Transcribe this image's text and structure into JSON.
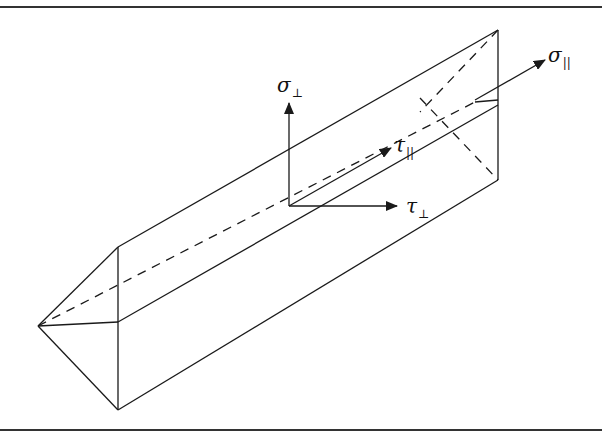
{
  "diagram": {
    "type": "prism stress components",
    "labels": {
      "sigma_perp": {
        "symbol": "σ",
        "subscript": "⊥"
      },
      "sigma_par": {
        "symbol": "σ",
        "subscript": "||"
      },
      "tau_par": {
        "symbol": "τ",
        "subscript": "||"
      },
      "tau_perp": {
        "symbol": "τ",
        "subscript": "⊥"
      }
    },
    "colors": {
      "line": "#1a1a1a",
      "frame": "#333333",
      "background": "#ffffff"
    }
  }
}
